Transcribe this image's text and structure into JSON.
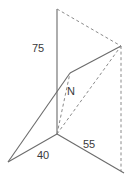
{
  "figure": {
    "background_color": "#ffffff",
    "stroke_color": "#6b6b6b",
    "dashed_stroke_color": "#8a8a8a",
    "label_color": "#3a3a3a",
    "labels": {
      "height": "75",
      "depth": "40",
      "width": "55",
      "point": "N"
    },
    "points": {
      "top_of_vertical": {
        "x": 57,
        "y": 9
      },
      "origin": {
        "x": 57,
        "y": 134
      },
      "apex_right": {
        "x": 121,
        "y": 46
      },
      "apex_bottom": {
        "x": 121,
        "y": 171
      },
      "bend": {
        "x": 70,
        "y": 73
      },
      "left_vertex": {
        "x": 8,
        "y": 162
      },
      "right_vertex": {
        "x": 124,
        "y": 173
      }
    }
  }
}
